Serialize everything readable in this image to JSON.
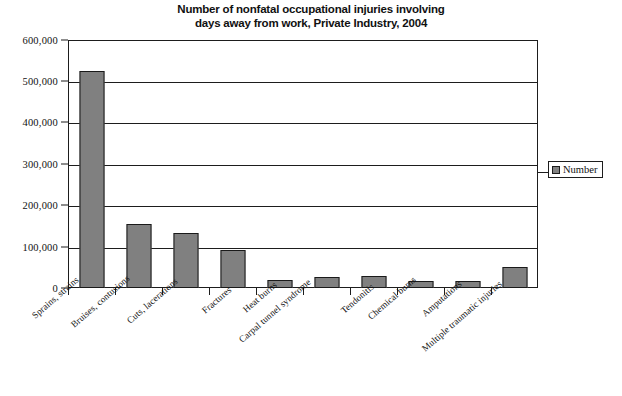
{
  "chart_data": {
    "type": "bar",
    "title": "Number of nonfatal occupational injuries involving days away from work, Private Industry, 2004",
    "title_lines": [
      "Number of nonfatal occupational injuries involving",
      "days away from work, Private Industry, 2004"
    ],
    "xlabel": "",
    "ylabel": "",
    "ylim": [
      0,
      600000
    ],
    "grid": true,
    "legend_position": "right",
    "categories": [
      "Sprains, strains",
      "Bruises, contusions",
      "Cuts, lacerations",
      "Fractures",
      "Heat burns",
      "Carpal tunnel syndrome",
      "Tendonitis",
      "Chemical burns",
      "Amputations",
      "Multiple traumatic injuries"
    ],
    "series": [
      {
        "name": "Number",
        "color": "#808080",
        "values": [
          524000,
          155000,
          133000,
          93000,
          19000,
          27000,
          28000,
          17000,
          17000,
          52000
        ]
      }
    ],
    "y_ticks": [
      {
        "value": 600000,
        "label": "600,000"
      },
      {
        "value": 500000,
        "label": "500,000"
      },
      {
        "value": 400000,
        "label": "400,000"
      },
      {
        "value": 300000,
        "label": "300,000"
      },
      {
        "value": 200000,
        "label": "200,000"
      },
      {
        "value": 100000,
        "label": "100,000"
      },
      {
        "value": 0,
        "label": "0"
      }
    ]
  },
  "legend": {
    "entries": [
      {
        "label": "Number",
        "color": "#808080"
      }
    ]
  },
  "footer": {
    "caption": ""
  },
  "colors": {
    "bar_fill": "#808080",
    "bar_stroke": "#1a1a1a",
    "axis": "#1d1d1d",
    "background": "#ffffff",
    "text": "#111111"
  }
}
